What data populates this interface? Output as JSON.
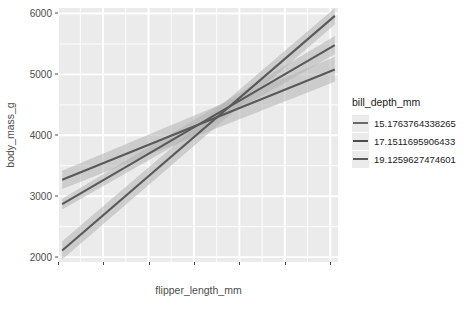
{
  "chart_data": {
    "type": "line",
    "title": "",
    "xlabel": "flipper_length_mm",
    "ylabel": "body_mass_g",
    "xlim": [
      170.3,
      231.7
    ],
    "ylim": [
      1920,
      6090
    ],
    "xticks": [
      170,
      180,
      190,
      200,
      210,
      220,
      230
    ],
    "yticks": [
      2000,
      3000,
      4000,
      5000,
      6000
    ],
    "xtick_labels": [
      "170",
      "180",
      "190",
      "200",
      "210",
      "220",
      "230"
    ],
    "ytick_labels": [
      "2000",
      "3000",
      "4000",
      "5000",
      "6000"
    ],
    "grid": true,
    "legend_position": "right",
    "legend_title": "bill_depth_mm",
    "panel_background": "#ebebeb",
    "grid_color": "#ffffff",
    "line_color": "#595959",
    "ribbon_color": "#b3b3b3",
    "series": [
      {
        "name": "15.1763764338265",
        "x": [
          171.0,
          231.0
        ],
        "values": [
          3270,
          5080
        ],
        "ribbon_lower": [
          3120,
          4880
        ],
        "ribbon_upper": [
          3420,
          5290
        ]
      },
      {
        "name": "17.1511695906433",
        "x": [
          171.0,
          231.0
        ],
        "values": [
          2870,
          5480
        ],
        "ribbon_lower": [
          2780,
          5330
        ],
        "ribbon_upper": [
          2960,
          5630
        ]
      },
      {
        "name": "19.1259627474601",
        "x": [
          171.0,
          231.0
        ],
        "values": [
          2110,
          5960
        ],
        "ribbon_lower": [
          1960,
          5820
        ],
        "ribbon_upper": [
          2260,
          6090
        ]
      }
    ],
    "intersection": {
      "x": 206,
      "y": 4300
    }
  },
  "legend": {
    "title": "bill_depth_mm",
    "items": [
      {
        "label": "15.1763764338265",
        "color": "#6b6b6b"
      },
      {
        "label": "17.1511695906433",
        "color": "#4d4d4d"
      },
      {
        "label": "19.1259627474601",
        "color": "#595959"
      }
    ]
  }
}
